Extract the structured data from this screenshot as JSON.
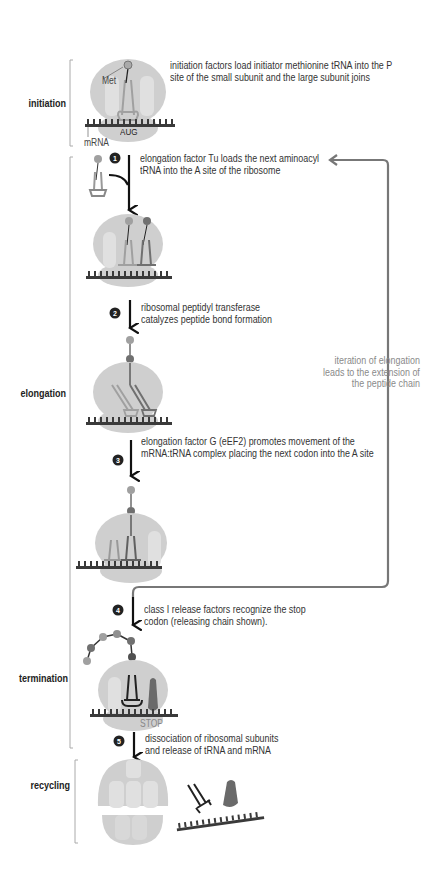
{
  "stages": [
    {
      "id": "initiation",
      "label": "initiation"
    },
    {
      "id": "elongation",
      "label": "elongation"
    },
    {
      "id": "termination",
      "label": "termination"
    },
    {
      "id": "recycling",
      "label": "recycling"
    }
  ],
  "steps": {
    "initiation": {
      "text_line1": "initiation factors load initiator methionine tRNA into the P",
      "text_line2": "site of the small subunit and the large subunit joins",
      "met_label": "Met",
      "codon_label": "AUG",
      "mrna_label": "mRNA"
    },
    "step1": {
      "number": "1",
      "text_line1": "elongation factor Tu loads the next aminoacyl",
      "text_line2": "tRNA into the A site of the ribosome"
    },
    "step2": {
      "number": "2",
      "text_line1": "ribosomal peptidyl transferase",
      "text_line2": "catalyzes peptide bond formation"
    },
    "step3": {
      "number": "3",
      "text_line1": "elongation factor G (eEF2) promotes movement of the",
      "text_line2": "mRNA:tRNA complex placing the next codon into the A site"
    },
    "step4": {
      "number": "4",
      "text_line1": "class I release factors recognize the stop",
      "text_line2": "codon (releasing chain shown).",
      "stop_label": "STOP"
    },
    "step5": {
      "number": "5",
      "text_line1": "dissociation of ribosomal subunits",
      "text_line2": "and release of tRNA and mRNA"
    }
  },
  "loop": {
    "text_line1": "iteration of elongation",
    "text_line2": "leads to the extension of",
    "text_line3": "the peptide chain"
  },
  "colors": {
    "ribosome": "#c8c8c8",
    "ribosome_light": "#dedede",
    "mrna": "#3a3a3a",
    "trna_light": "#a9a9a9",
    "trna_dark": "#5a5a5a",
    "amino_light": "#a0a0a0",
    "amino_dark": "#5a5a5a",
    "loop_arrow": "#777777",
    "release_factor": "#6a6a6a"
  }
}
